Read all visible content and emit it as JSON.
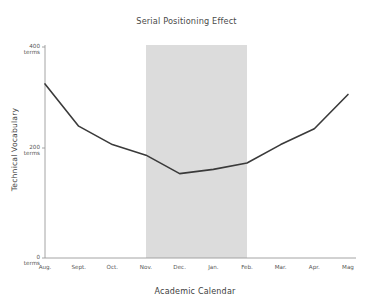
{
  "chart_data": {
    "type": "line",
    "title": "Serial Positioning Effect",
    "xlabel": "Academic Calendar",
    "ylabel": "Technical Vocabulary",
    "categories": [
      "Aug.",
      "Sept.",
      "Oct.",
      "Nov.",
      "Dec.",
      "Jan.",
      "Feb.",
      "Mar.",
      "Apr.",
      "Mag"
    ],
    "values": [
      330,
      250,
      215,
      195,
      160,
      168,
      180,
      215,
      245,
      310
    ],
    "series": [
      {
        "name": "Technical Vocabulary",
        "values": [
          330,
          250,
          215,
          195,
          160,
          168,
          180,
          215,
          245,
          310
        ],
        "color": "#3a3a3a",
        "line_width": 1.6
      }
    ],
    "ylim": [
      0,
      400
    ],
    "ytick_values": [
      0,
      200,
      400
    ],
    "ytick_labels": [
      "0\nterms",
      "200\nterms",
      "400\nterms"
    ],
    "ytick_label_lines": [
      [
        "0",
        "terms"
      ],
      [
        "200",
        "terms"
      ],
      [
        "400",
        "terms"
      ]
    ],
    "grid": false,
    "legend": false,
    "legend_position": "none",
    "spines": [
      "left",
      "bottom"
    ],
    "annotations": [
      {
        "type": "vertical-span",
        "name": "highlight-band",
        "from_category": "Nov.",
        "to_category": "Feb.",
        "color": "#dcdcdc",
        "opacity": 1
      }
    ],
    "background_color": "#ffffff",
    "axis_color": "#9a9a9a",
    "text_color": "#3f3f3f"
  }
}
